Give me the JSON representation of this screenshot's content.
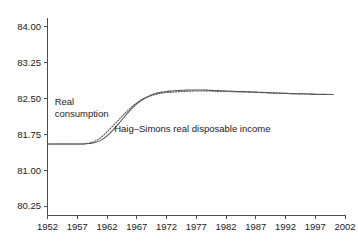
{
  "chart_data": {
    "type": "line",
    "title": "",
    "subtitle": "",
    "xlabel": "",
    "ylabel": "",
    "xlim": [
      1952,
      2002
    ],
    "ylim": [
      80.0625,
      84.1875
    ],
    "grid": false,
    "legend_position": "inline-annotations",
    "x_ticks": [
      "1952",
      "1957",
      "1962",
      "1967",
      "1972",
      "1977",
      "1982",
      "1987",
      "1992",
      "1997",
      "2002"
    ],
    "y_ticks": [
      "84.00",
      "83.25",
      "82.50",
      "81.75",
      "81.00",
      "80.25"
    ],
    "x": [
      1952,
      1953,
      1954,
      1955,
      1956,
      1957,
      1958,
      1959,
      1960,
      1961,
      1962,
      1963,
      1964,
      1965,
      1966,
      1967,
      1968,
      1969,
      1970,
      1971,
      1972,
      1973,
      1974,
      1975,
      1976,
      1977,
      1978,
      1979,
      1980,
      1981,
      1982,
      1983,
      1984,
      1985,
      1986,
      1987,
      1988,
      1989,
      1990,
      1991,
      1992,
      1993,
      1994,
      1995,
      1996,
      1997,
      1998,
      1999,
      2000
    ],
    "series": [
      {
        "name": "Real consumption",
        "style": "solid",
        "values": [
          81.55,
          81.55,
          81.55,
          81.55,
          81.55,
          81.55,
          81.55,
          81.56,
          81.58,
          81.63,
          81.72,
          81.84,
          81.98,
          82.13,
          82.27,
          82.39,
          82.48,
          82.55,
          82.6,
          82.63,
          82.65,
          82.66,
          82.67,
          82.675,
          82.68,
          82.68,
          82.68,
          82.675,
          82.67,
          82.665,
          82.66,
          82.655,
          82.65,
          82.645,
          82.64,
          82.635,
          82.63,
          82.625,
          82.62,
          82.615,
          82.61,
          82.605,
          82.6,
          82.6,
          82.595,
          82.59,
          82.59,
          82.585,
          82.585
        ]
      },
      {
        "name": "Haig–Simons real disposable income",
        "style": "dotted",
        "values": [
          81.55,
          81.55,
          81.55,
          81.55,
          81.55,
          81.55,
          81.55,
          81.57,
          81.61,
          81.69,
          81.8,
          81.93,
          82.06,
          82.19,
          82.31,
          82.41,
          82.49,
          82.54,
          82.58,
          82.61,
          82.625,
          82.635,
          82.645,
          82.65,
          82.655,
          82.66,
          82.66,
          82.66,
          82.655,
          82.65,
          82.65,
          82.645,
          82.64,
          82.64,
          82.635,
          82.63,
          82.625,
          82.62,
          82.615,
          82.61,
          82.61,
          82.605,
          82.6,
          82.595,
          82.595,
          82.59,
          82.585,
          82.585,
          82.585
        ]
      }
    ],
    "annotations": [
      {
        "id": "real-consumption",
        "lines": [
          "Real",
          "consumption"
        ],
        "x": 1953.2,
        "y": 82.36
      },
      {
        "id": "haig-simons",
        "lines": [
          "Haig–Simons real disposable income"
        ],
        "x": 1963.2,
        "y": 81.8
      }
    ],
    "colors": {
      "line": "#555555",
      "axis": "#4d4d4d",
      "text": "#1a1a1a",
      "background": "#ffffff"
    }
  }
}
